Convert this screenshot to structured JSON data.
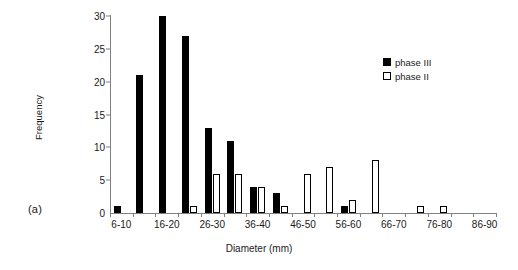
{
  "panel": {
    "label": "(a)"
  },
  "legend": {
    "position": "top-right",
    "entries": [
      {
        "label": "phase III",
        "swatch": "filled-square",
        "color": "#000000"
      },
      {
        "label": "phase II",
        "swatch": "hollow-square",
        "color": "#ffffff"
      }
    ]
  },
  "chart_data": {
    "type": "bar",
    "title": "",
    "subtitle": "",
    "xlabel": "Diameter (mm)",
    "ylabel": "Frequency",
    "ylim": [
      0,
      30
    ],
    "yticks": [
      0,
      5,
      10,
      15,
      20,
      25,
      30
    ],
    "grid": false,
    "legend_position": "top-right",
    "categories": [
      "6-10",
      "11-15",
      "16-20",
      "21-25",
      "26-30",
      "31-35",
      "36-40",
      "41-45",
      "46-50",
      "51-55",
      "56-60",
      "61-65",
      "66-70",
      "71-75",
      "76-80",
      "81-85",
      "86-90"
    ],
    "xtick_labels": [
      "6-10",
      "",
      "16-20",
      "",
      "26-30",
      "",
      "36-40",
      "",
      "46-50",
      "",
      "56-60",
      "",
      "66-70",
      "",
      "76-80",
      "",
      "86-90"
    ],
    "series": [
      {
        "name": "phase III",
        "color": "#000000",
        "values": [
          1,
          21,
          30,
          27,
          13,
          11,
          4,
          3,
          0,
          0,
          1,
          0,
          0,
          0,
          0,
          0,
          0
        ]
      },
      {
        "name": "phase II",
        "color": "#ffffff",
        "values": [
          0,
          0,
          0,
          1,
          6,
          6,
          4,
          1,
          6,
          7,
          2,
          8,
          0,
          1,
          1,
          0,
          0
        ]
      }
    ]
  }
}
